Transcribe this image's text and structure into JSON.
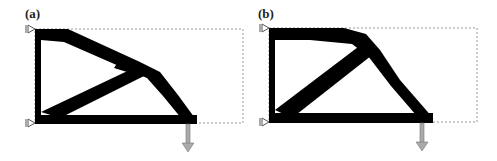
{
  "figure": {
    "panels": [
      {
        "label": "(a)",
        "description": "topology-optimized cantilever design with top chord, diagonal struts, bottom chord; supports on left edge, downward point load at bottom",
        "colors": {
          "material": "#000000",
          "domain_border": "#999999",
          "load_arrow": "#9a9a9a",
          "support": "#555555"
        }
      },
      {
        "label": "(b)",
        "description": "alternate topology-optimized cantilever design with straighter top chord and single long diagonal; supports on left edge, downward point load at bottom",
        "colors": {
          "material": "#000000",
          "domain_border": "#999999",
          "load_arrow": "#9a9a9a",
          "support": "#555555"
        }
      }
    ]
  }
}
